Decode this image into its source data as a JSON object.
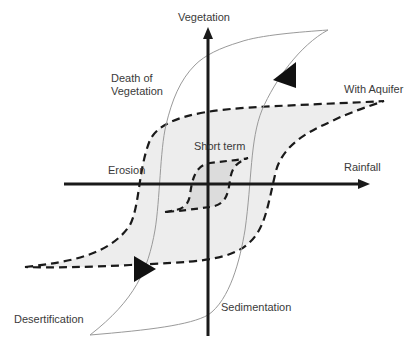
{
  "diagram": {
    "axes": {
      "y_label": "Vegetation",
      "x_label": "Rainfall"
    },
    "labels": {
      "death_of_vegetation": "Death of\nVegetation",
      "with_aquifer": "With Aquifer",
      "short_term": "Short term",
      "erosion": "Erosion",
      "desertification": "Desertification",
      "sedimentation": "Sedimentation"
    },
    "colors": {
      "axis": "#1a1a1a",
      "dashed_loop": "#1a1a1a",
      "outer_fill": "#ededed",
      "inner_fill": "#dcdcdc",
      "thin_curve": "#9a9a9a",
      "arrowhead": "#111111",
      "text": "#3a3a3a"
    }
  }
}
